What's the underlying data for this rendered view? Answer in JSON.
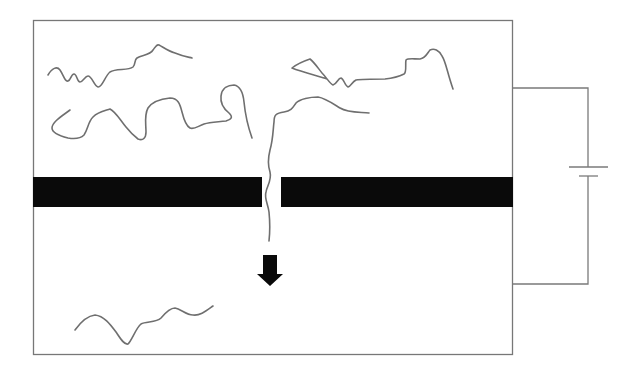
{
  "diagram": {
    "title": "",
    "colors": {
      "background": "#ffffff",
      "membrane": "#0a0a0a",
      "chain": "#6f6f6f",
      "wire": "#7a7a7a",
      "arrow": "#0a0a0a"
    },
    "components": {
      "chamber": {
        "label": "",
        "x": 33,
        "y": 20,
        "width": 480,
        "height": 335
      },
      "membrane": {
        "label": "",
        "y": 177,
        "height": 30,
        "left_segment": {
          "x": 33,
          "width": 229
        },
        "pore_gap": {
          "x": 262,
          "width": 19
        },
        "right_segment": {
          "x": 281,
          "width": 232
        }
      },
      "battery": {
        "label": "",
        "icon": "battery-icon",
        "long_plate": {
          "x1": 569,
          "x2": 608,
          "y": 167
        },
        "short_plate": {
          "x1": 579,
          "x2": 598,
          "y": 176
        }
      },
      "circuit_wire": {
        "top_y": 88,
        "bottom_y": 284,
        "x": 588
      },
      "arrow": {
        "label": "",
        "icon": "arrow-down-icon",
        "direction": "down",
        "x": 270,
        "y_top": 255,
        "y_bottom": 285
      }
    },
    "chains": [
      {
        "name": "upper-chain-1",
        "region": "upper-chamber"
      },
      {
        "name": "upper-chain-2",
        "region": "upper-chamber"
      },
      {
        "name": "upper-chain-3",
        "region": "upper-chamber"
      },
      {
        "name": "translocating-chain",
        "region": "through-pore"
      },
      {
        "name": "lower-chain",
        "region": "lower-chamber"
      }
    ]
  }
}
